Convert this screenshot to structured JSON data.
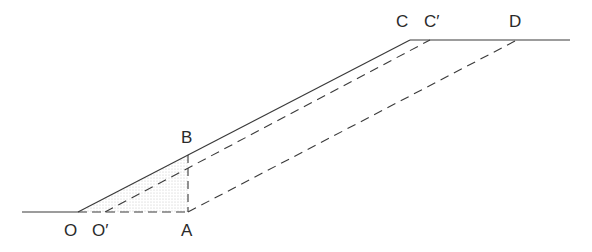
{
  "labels": {
    "O": "O",
    "O_prime": "O′",
    "A": "A",
    "B": "B",
    "C": "C",
    "C_prime": "C′",
    "D": "D"
  },
  "points": {
    "O": [
      78,
      212
    ],
    "O_prime": [
      105,
      212
    ],
    "A": [
      188,
      212
    ],
    "B": [
      188,
      155
    ],
    "C": [
      410,
      40
    ],
    "C_prime": [
      430,
      40
    ],
    "D": [
      517,
      40
    ]
  },
  "colors": {
    "line": "#3a3a3a",
    "stipple": "#cfcfcf"
  }
}
